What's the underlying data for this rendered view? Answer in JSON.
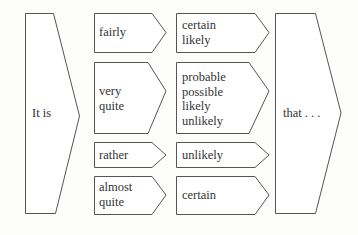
{
  "diagram": {
    "start": {
      "label": "It is"
    },
    "end": {
      "label": "that . . ."
    },
    "rows": [
      {
        "modifiers": [
          "fairly"
        ],
        "adjectives": [
          "certain",
          "likely"
        ]
      },
      {
        "modifiers": [
          "very",
          "quite"
        ],
        "adjectives": [
          "probable",
          "possible",
          "likely",
          "unlikely"
        ]
      },
      {
        "modifiers": [
          "rather"
        ],
        "adjectives": [
          "unlikely"
        ]
      },
      {
        "modifiers": [
          "almost",
          "quite"
        ],
        "adjectives": [
          "certain"
        ]
      }
    ]
  },
  "colors": {
    "stroke": "#555555",
    "text": "#333333",
    "background": "#fdfdfc"
  }
}
